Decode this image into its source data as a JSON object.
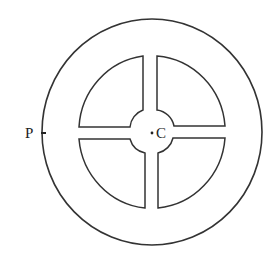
{
  "diagram": {
    "type": "wheel-with-spokes",
    "labels": {
      "point_p": "P",
      "center_c": "C"
    },
    "colors": {
      "stroke": "#333333",
      "background": "#ffffff"
    }
  }
}
